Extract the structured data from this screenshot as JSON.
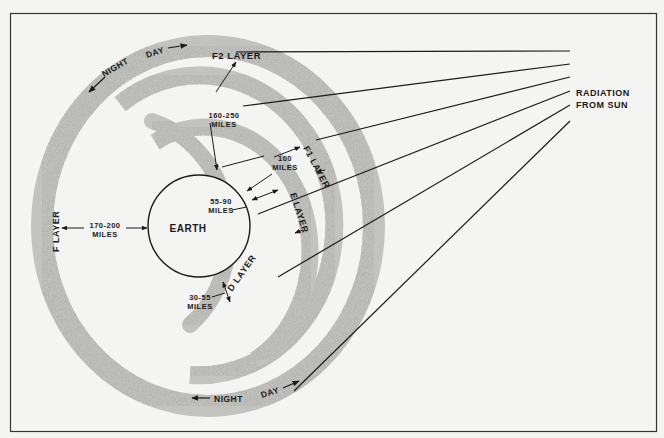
{
  "diagram": {
    "center_label": "EARTH",
    "source_label_line1": "RADIATION",
    "source_label_line2": "FROM SUN",
    "direction_top": {
      "night": "NIGHT",
      "day": "DAY"
    },
    "direction_bottom": {
      "night": "NIGHT",
      "day": "DAY"
    },
    "layers": [
      {
        "id": "f2",
        "label": "F2 LAYER",
        "distance_line1": "160-250",
        "distance_line2": "MILES"
      },
      {
        "id": "f1",
        "label": "F1 LAYER",
        "distance_line1": "100",
        "distance_line2": "MILES"
      },
      {
        "id": "e",
        "label": "E LAYER",
        "distance_line1": "55-90",
        "distance_line2": "MILES"
      },
      {
        "id": "d",
        "label": "D LAYER",
        "distance_line1": "30-55",
        "distance_line2": "MILES"
      },
      {
        "id": "f",
        "label": "F LAYER",
        "distance_line1": "170-200",
        "distance_line2": "MILES"
      }
    ],
    "colors": {
      "background": "#f4f4f2",
      "ink": "#1a1a1a",
      "layer_fill": "#b8b8b4"
    }
  }
}
